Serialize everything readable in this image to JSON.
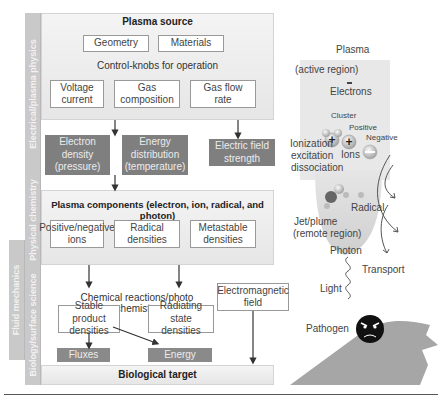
{
  "side_labels": {
    "electrical": "Electrical/plasma physics",
    "chemistry": "Physical chemistry",
    "fluid": "Fluid mechanics",
    "biology": "Biology/surface science"
  },
  "plasma_source": {
    "title": "Plasma source",
    "geometry": "Geometry",
    "materials": "Materials",
    "control_title": "Control-knobs for operation",
    "knobs": [
      "Voltage current",
      "Gas composition",
      "Gas flow rate"
    ]
  },
  "parameters": {
    "electron_density": "Electron density (pressure)",
    "energy_distribution": "Energy distribution (temperature)",
    "electric_field": "Electric field strength"
  },
  "plasma_components": {
    "title": "Plasma components (electron, ion, radical, and photon)",
    "items": [
      "Positive/negative ions",
      "Radical densities",
      "Metastable densities"
    ]
  },
  "chemistry": {
    "title": "Chemical reactions/photo chemistry",
    "stable": "Stable product densities",
    "radiating": "Radiating state densities",
    "em_field": "Electromagnetic field"
  },
  "outputs": {
    "fluxes": "Fluxes",
    "energy": "Energy"
  },
  "target": {
    "label": "Biological target"
  },
  "illustration": {
    "plasma": "Plasma",
    "active_region": "(active region)",
    "electrons": "Electrons",
    "cluster": "Cluster",
    "positive": "Positive",
    "negative": "Negative",
    "ions": "Ions",
    "processes": [
      "Ionization",
      "excitation",
      "dissociation"
    ],
    "radical": "Radical",
    "jet_plume": "Jet/plume",
    "remote_region": "(remote region)",
    "photon": "Photon",
    "transport": "Transport",
    "light": "Light",
    "pathogen": "Pathogen"
  },
  "colors": {
    "panel": "#ececec",
    "dark_box": "#7f7f7f",
    "side_label": "#c9c9c9",
    "plume": "#d6d6d6",
    "tissue": "#a6a6a6"
  }
}
